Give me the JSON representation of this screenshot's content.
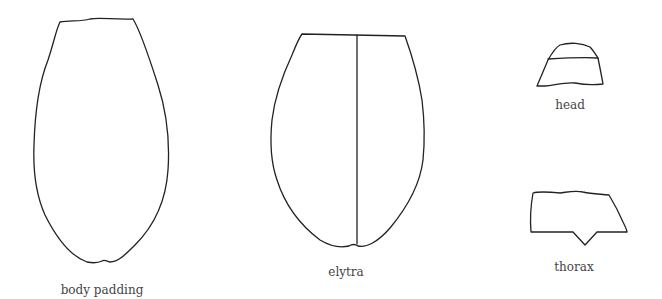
{
  "diagram": {
    "parts": [
      {
        "id": "body-padding",
        "label": "body padding"
      },
      {
        "id": "elytra",
        "label": "elytra"
      },
      {
        "id": "head",
        "label": "head"
      },
      {
        "id": "thorax",
        "label": "thorax"
      }
    ],
    "stroke_color": "#222222",
    "label_color": "#444444",
    "background": "#ffffff"
  }
}
